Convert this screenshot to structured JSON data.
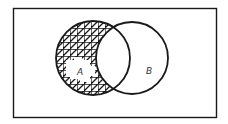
{
  "diagram": {
    "type": "venn",
    "universe": {
      "x": 13,
      "y": 8,
      "width": 203,
      "height": 109
    },
    "sets": [
      {
        "label": "A",
        "cx": 93,
        "cy": 58,
        "r": 37
      },
      {
        "label": "B",
        "cx": 132,
        "cy": 58,
        "r": 36
      }
    ],
    "shaded_region": "A - B",
    "labels": {
      "a": "A",
      "b": "B"
    },
    "colors": {
      "stroke": "#1a1a1a",
      "background": "#ffffff",
      "hatch": "#1a1a1a",
      "label": "#333333"
    }
  }
}
